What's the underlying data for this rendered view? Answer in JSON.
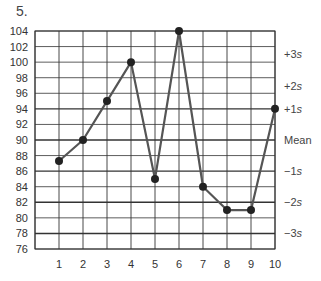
{
  "problem_number": "5.",
  "chart_data": {
    "type": "line",
    "title": "",
    "xlabel": "",
    "ylabel": "",
    "x": [
      1,
      2,
      3,
      4,
      5,
      6,
      7,
      8,
      9,
      10
    ],
    "values": [
      87.3,
      90,
      95,
      100,
      85,
      104,
      84,
      81,
      81,
      94
    ],
    "series": [
      {
        "name": "Measurements",
        "values": [
          87.3,
          90,
          95,
          100,
          85,
          104,
          84,
          81,
          81,
          94
        ]
      }
    ],
    "x_tick_labels": [
      "1",
      "2",
      "3",
      "4",
      "5",
      "6",
      "7",
      "8",
      "9",
      "10"
    ],
    "y_tick_labels": [
      "104",
      "102",
      "100",
      "98",
      "96",
      "94",
      "92",
      "90",
      "88",
      "86",
      "84",
      "82",
      "80",
      "78",
      "76"
    ],
    "ylim": [
      76,
      104
    ],
    "xlim": [
      0,
      10
    ],
    "grid": true,
    "legend": null,
    "control_limits": [
      {
        "label": "+3s",
        "value": 101
      },
      {
        "label": "+2s",
        "value": 97
      },
      {
        "label": "+1s",
        "value": 94
      },
      {
        "label": "Mean",
        "value": 90
      },
      {
        "label": "−1s",
        "value": 86
      },
      {
        "label": "−2s",
        "value": 82
      },
      {
        "label": "−3s",
        "value": 78
      }
    ],
    "colors": {
      "line": "#555555",
      "marker": "#222222",
      "grid": "#333333"
    }
  }
}
